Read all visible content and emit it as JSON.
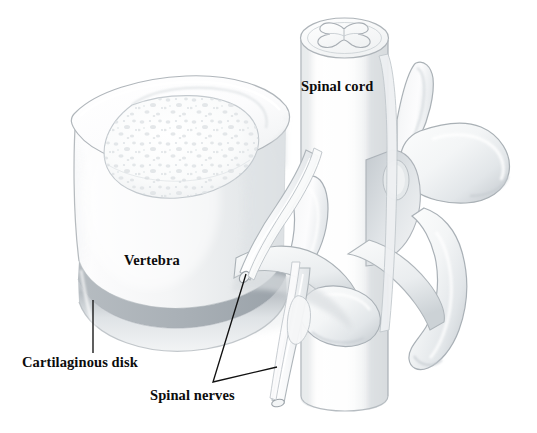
{
  "figure": {
    "style": "grayscale pencil / airbrush anatomical illustration",
    "background_color": "#ffffff",
    "width": 537,
    "height": 433
  },
  "labels": {
    "spinal_cord": "Spinal cord",
    "vertebra": "Vertebra",
    "cartilaginous_disk": "Cartilaginous disk",
    "spinal_nerves": "Spinal nerves"
  },
  "label_positions": {
    "spinal_cord": {
      "x": 301,
      "y": 79
    },
    "vertebra": {
      "x": 124,
      "y": 253
    },
    "cartilaginous_disk": {
      "x": 22,
      "y": 355
    },
    "spinal_nerves": {
      "x": 150,
      "y": 388
    }
  },
  "leader_lines": [
    {
      "name": "cartilaginous-disk-leader",
      "points": "93,300 93,353"
    },
    {
      "name": "spinal-nerves-leader-upper",
      "points": "213,382 246,274"
    },
    {
      "name": "spinal-nerves-leader-lower",
      "points": "213,382 277,367"
    }
  ],
  "colors": {
    "text": "#0c0c0c",
    "leader_line": "#111111",
    "outline": "#9aa0a4",
    "outline_light": "#bcc2c6",
    "bone_light": "#fdfdfd",
    "bone_mid": "#eceeef",
    "bone_shadow": "#d3d7da",
    "disk_band": "#c9ced2",
    "disk_shadow": "#b2b8bd",
    "cord_fill": "#fbfcfc",
    "cord_shade": "#e3e6e8",
    "gray_matter": "#f4f5f6"
  },
  "anatomy_parts": [
    {
      "name": "vertebral-body",
      "description": "Large cylindrical vertebral body seen from above-left, with cortical rim and speckled cancellous bone on superior surface"
    },
    {
      "name": "cancellous-bone-texture",
      "description": "Speckled trabecular bone filling the superior endplate of the vertebral body"
    },
    {
      "name": "cartilaginous-disk",
      "description": "Gray banded intervertebral disk beneath the vertebral body"
    },
    {
      "name": "spinal-cord",
      "description": "Vertical cut cylinder of spinal cord with butterfly-shaped gray matter on its cut superior surface"
    },
    {
      "name": "gray-matter-butterfly",
      "description": "H / butterfly shaped gray matter in the spinal cord cross-section"
    },
    {
      "name": "pedicle",
      "description": "Bony bridge connecting vertebral body to posterior arch"
    },
    {
      "name": "superior-articular-process",
      "description": "Upward projecting process on the right posterior arch"
    },
    {
      "name": "transverse-process",
      "description": "Large lateral wing-shaped process on the right"
    },
    {
      "name": "inferior-articular-process",
      "description": "Downward projecting process below the transverse process"
    },
    {
      "name": "spinal-nerve-root-upper",
      "description": "Nerve root exiting anterolaterally and cut at its end"
    },
    {
      "name": "spinal-nerve-root-lower",
      "description": "Second nerve root descending and cut at its end"
    },
    {
      "name": "intervertebral-foramen",
      "description": "Opening visible behind the nerve roots"
    }
  ]
}
